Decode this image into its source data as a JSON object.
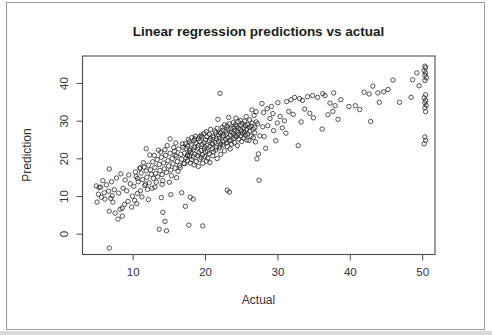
{
  "window": {
    "background": "#ffffff",
    "frame_border_color": "#9a9a9a"
  },
  "chart_data": {
    "type": "scatter",
    "title": "Linear regression predictions vs actual",
    "xlabel": "Actual",
    "ylabel": "Prediction",
    "xlim": [
      3.0,
      51.7
    ],
    "ylim": [
      -5.4,
      47.3
    ],
    "x_ticks": [
      10,
      20,
      30,
      40,
      50
    ],
    "y_ticks": [
      0,
      10,
      20,
      30,
      40
    ],
    "grid": false,
    "legend": "none",
    "marker": "open-circle",
    "marker_color": "#2a2a2a",
    "box_color": "#4d4d4d",
    "tick_label_color": "#333333",
    "points": [
      [
        4.9,
        12.8
      ],
      [
        5.3,
        12.4
      ],
      [
        5.5,
        12.5
      ],
      [
        5.2,
        10.6
      ],
      [
        5.0,
        8.5
      ],
      [
        6.1,
        9.3
      ],
      [
        6.9,
        9.5
      ],
      [
        6.6,
        11.4
      ],
      [
        7.2,
        8.5
      ],
      [
        6.7,
        6.1
      ],
      [
        7.5,
        5.6
      ],
      [
        8.2,
        6.6
      ],
      [
        8.5,
        4.8
      ],
      [
        7.9,
        4.0
      ],
      [
        8.8,
        7.9
      ],
      [
        9.3,
        8.7
      ],
      [
        9.9,
        10.1
      ],
      [
        7.0,
        13.9
      ],
      [
        7.7,
        14.9
      ],
      [
        8.3,
        16.0
      ],
      [
        6.7,
        17.3
      ],
      [
        5.8,
        14.2
      ],
      [
        6.3,
        13.1
      ],
      [
        7.4,
        11.8
      ],
      [
        8.0,
        10.9
      ],
      [
        8.6,
        12.2
      ],
      [
        9.1,
        11.5
      ],
      [
        9.6,
        13.4
      ],
      [
        10.1,
        12.7
      ],
      [
        8.5,
        6.9
      ],
      [
        7.1,
        10.2
      ],
      [
        6.0,
        11.0
      ],
      [
        5.6,
        9.8
      ],
      [
        10.2,
        9.0
      ],
      [
        9.8,
        7.2
      ],
      [
        10.5,
        8.1
      ],
      [
        11.2,
        9.9
      ],
      [
        10.3,
        16.5
      ],
      [
        11.0,
        17.6
      ],
      [
        10.6,
        14.8
      ],
      [
        9.4,
        15.7
      ],
      [
        8.9,
        14.4
      ],
      [
        6.7,
        -3.7
      ],
      [
        13.6,
        1.3
      ],
      [
        14.6,
        0.9
      ],
      [
        17.7,
        2.4
      ],
      [
        19.6,
        2.2
      ],
      [
        14.4,
        3.4
      ],
      [
        14.1,
        5.8
      ],
      [
        17.2,
        7.4
      ],
      [
        18.3,
        9.3
      ],
      [
        13.9,
        9.7
      ],
      [
        17.9,
        9.8
      ],
      [
        12.1,
        9.2
      ],
      [
        10.4,
        15.3
      ],
      [
        10.7,
        13.9
      ],
      [
        11.1,
        16.2
      ],
      [
        11.3,
        14.5
      ],
      [
        11.5,
        17.8
      ],
      [
        11.6,
        12.9
      ],
      [
        11.8,
        16.8
      ],
      [
        11.9,
        15.1
      ],
      [
        12.1,
        18.3
      ],
      [
        12.2,
        13.6
      ],
      [
        12.4,
        17.1
      ],
      [
        12.5,
        15.9
      ],
      [
        12.7,
        19.2
      ],
      [
        12.8,
        14.8
      ],
      [
        13.0,
        17.7
      ],
      [
        13.1,
        16.1
      ],
      [
        13.3,
        19.8
      ],
      [
        13.4,
        15.2
      ],
      [
        13.6,
        18.5
      ],
      [
        13.7,
        16.9
      ],
      [
        13.9,
        20.4
      ],
      [
        14.0,
        15.8
      ],
      [
        14.2,
        18.9
      ],
      [
        14.3,
        17.3
      ],
      [
        14.5,
        20.9
      ],
      [
        14.6,
        16.4
      ],
      [
        14.8,
        19.5
      ],
      [
        14.9,
        18.1
      ],
      [
        15.1,
        21.5
      ],
      [
        15.2,
        17.0
      ],
      [
        15.4,
        20.1
      ],
      [
        15.5,
        18.7
      ],
      [
        15.7,
        22.0
      ],
      [
        15.8,
        17.5
      ],
      [
        16.0,
        20.7
      ],
      [
        16.1,
        19.3
      ],
      [
        16.3,
        22.6
      ],
      [
        16.4,
        18.2
      ],
      [
        16.6,
        21.2
      ],
      [
        16.7,
        19.9
      ],
      [
        16.9,
        23.1
      ],
      [
        17.0,
        18.8
      ],
      [
        11.0,
        11.5
      ],
      [
        12.0,
        11.9
      ],
      [
        13.0,
        12.5
      ],
      [
        14.0,
        13.2
      ],
      [
        15.0,
        13.8
      ],
      [
        16.0,
        15.0
      ],
      [
        12.3,
        21.0
      ],
      [
        13.5,
        22.3
      ],
      [
        14.7,
        23.5
      ],
      [
        15.9,
        24.2
      ],
      [
        11.4,
        19.0
      ],
      [
        10.9,
        17.5
      ],
      [
        12.9,
        20.9
      ],
      [
        13.8,
        21.8
      ],
      [
        14.4,
        22.4
      ],
      [
        15.6,
        23.0
      ],
      [
        16.8,
        24.0
      ],
      [
        16.2,
        16.7
      ],
      [
        15.3,
        15.5
      ],
      [
        14.1,
        14.2
      ],
      [
        13.2,
        13.8
      ],
      [
        12.6,
        12.2
      ],
      [
        11.7,
        13.3
      ],
      [
        10.6,
        10.8
      ],
      [
        16.5,
        17.7
      ],
      [
        15.1,
        25.3
      ],
      [
        11.8,
        22.7
      ],
      [
        15.8,
        21.0
      ],
      [
        15.2,
        10.5
      ],
      [
        16.7,
        11.0
      ],
      [
        17.1,
        21.5
      ],
      [
        17.1,
        18.7
      ],
      [
        17.2,
        24.0
      ],
      [
        17.3,
        20.2
      ],
      [
        17.3,
        22.8
      ],
      [
        17.5,
        19.5
      ],
      [
        17.5,
        23.4
      ],
      [
        17.5,
        21.0
      ],
      [
        17.6,
        25.1
      ],
      [
        17.8,
        20.8
      ],
      [
        17.8,
        22.1
      ],
      [
        17.8,
        24.5
      ],
      [
        17.9,
        18.9
      ],
      [
        18.0,
        21.7
      ],
      [
        18.0,
        23.9
      ],
      [
        18.1,
        19.8
      ],
      [
        18.1,
        25.6
      ],
      [
        18.3,
        22.4
      ],
      [
        18.3,
        20.5
      ],
      [
        18.4,
        24.8
      ],
      [
        18.4,
        18.4
      ],
      [
        18.5,
        21.2
      ],
      [
        18.5,
        23.0
      ],
      [
        18.6,
        26.0
      ],
      [
        18.7,
        19.3
      ],
      [
        18.7,
        24.2
      ],
      [
        18.9,
        22.9
      ],
      [
        18.9,
        20.9
      ],
      [
        19.0,
        25.3
      ],
      [
        19.0,
        23.5
      ],
      [
        19.0,
        18.0
      ],
      [
        19.1,
        21.6
      ],
      [
        19.2,
        24.6
      ],
      [
        19.2,
        19.9
      ],
      [
        19.4,
        22.2
      ],
      [
        19.4,
        26.3
      ],
      [
        19.4,
        20.3
      ],
      [
        19.5,
        23.8
      ],
      [
        19.5,
        25.8
      ],
      [
        19.6,
        21.1
      ],
      [
        19.6,
        18.8
      ],
      [
        19.8,
        24.3
      ],
      [
        19.8,
        22.6
      ],
      [
        19.8,
        26.7
      ],
      [
        19.9,
        20.6
      ],
      [
        19.9,
        23.2
      ],
      [
        20.0,
        25.0
      ],
      [
        20.0,
        21.9
      ],
      [
        20.1,
        27.2
      ],
      [
        20.1,
        19.4
      ],
      [
        20.2,
        23.6
      ],
      [
        20.2,
        25.9
      ],
      [
        20.3,
        22.0
      ],
      [
        20.3,
        20.2
      ],
      [
        20.5,
        24.9
      ],
      [
        20.5,
        26.5
      ],
      [
        20.5,
        21.4
      ],
      [
        20.6,
        23.3
      ],
      [
        20.6,
        19.0
      ],
      [
        20.7,
        27.8
      ],
      [
        20.7,
        25.4
      ],
      [
        20.9,
        22.7
      ],
      [
        20.9,
        24.1
      ],
      [
        21.0,
        26.1
      ],
      [
        21.0,
        20.8
      ],
      [
        21.0,
        23.9
      ],
      [
        21.1,
        25.7
      ],
      [
        21.1,
        21.8
      ],
      [
        21.3,
        27.4
      ],
      [
        21.3,
        24.4
      ],
      [
        21.4,
        22.3
      ],
      [
        21.4,
        26.9
      ],
      [
        21.5,
        25.2
      ],
      [
        21.5,
        23.0
      ],
      [
        21.6,
        28.1
      ],
      [
        21.6,
        20.1
      ],
      [
        21.8,
        24.7
      ],
      [
        21.8,
        26.4
      ],
      [
        21.9,
        22.9
      ],
      [
        21.9,
        25.5
      ],
      [
        22.0,
        27.0
      ],
      [
        22.0,
        23.4
      ],
      [
        22.1,
        24.0
      ],
      [
        22.1,
        26.8
      ],
      [
        22.1,
        21.2
      ],
      [
        22.3,
        25.8
      ],
      [
        22.3,
        28.4
      ],
      [
        22.4,
        23.7
      ],
      [
        22.4,
        27.6
      ],
      [
        22.5,
        26.2
      ],
      [
        22.5,
        24.5
      ],
      [
        22.6,
        29.0
      ],
      [
        22.6,
        22.1
      ],
      [
        22.8,
        27.3
      ],
      [
        22.8,
        25.1
      ],
      [
        22.9,
        24.2
      ],
      [
        22.9,
        26.6
      ],
      [
        23.0,
        28.7
      ],
      [
        23.0,
        23.3
      ],
      [
        23.1,
        25.6
      ],
      [
        23.1,
        27.9
      ],
      [
        23.3,
        24.8
      ],
      [
        23.3,
        29.3
      ],
      [
        23.4,
        26.3
      ],
      [
        23.4,
        22.6
      ],
      [
        23.5,
        28.0
      ],
      [
        23.5,
        25.0
      ],
      [
        23.6,
        27.1
      ],
      [
        23.6,
        23.9
      ],
      [
        23.8,
        29.6
      ],
      [
        23.8,
        26.7
      ],
      [
        23.9,
        25.4
      ],
      [
        23.9,
        28.3
      ],
      [
        24.0,
        27.5
      ],
      [
        24.0,
        24.3
      ],
      [
        24.1,
        26.0
      ],
      [
        24.1,
        29.0
      ],
      [
        24.3,
        28.6
      ],
      [
        24.3,
        25.9
      ],
      [
        24.4,
        27.2
      ],
      [
        24.4,
        23.5
      ],
      [
        24.5,
        29.9
      ],
      [
        24.5,
        26.5
      ],
      [
        24.6,
        28.1
      ],
      [
        24.6,
        25.2
      ],
      [
        24.8,
        27.7
      ],
      [
        24.8,
        30.2
      ],
      [
        24.9,
        26.1
      ],
      [
        24.9,
        28.9
      ],
      [
        25.0,
        24.6
      ],
      [
        25.0,
        27.4
      ],
      [
        25.1,
        29.4
      ],
      [
        25.1,
        26.8
      ],
      [
        25.3,
        28.2
      ],
      [
        25.3,
        25.5
      ],
      [
        25.4,
        30.0
      ],
      [
        25.4,
        27.0
      ],
      [
        25.5,
        26.3
      ],
      [
        25.5,
        28.8
      ],
      [
        25.7,
        25.0
      ],
      [
        25.7,
        27.8
      ],
      [
        25.8,
        29.1
      ],
      [
        25.8,
        26.6
      ],
      [
        26.0,
        28.4
      ],
      [
        26.0,
        24.9
      ],
      [
        26.1,
        27.3
      ],
      [
        26.1,
        30.3
      ],
      [
        26.3,
        26.0
      ],
      [
        26.3,
        28.7
      ],
      [
        26.4,
        29.5
      ],
      [
        26.6,
        27.9
      ],
      [
        26.6,
        25.6
      ],
      [
        26.8,
        28.3
      ],
      [
        26.8,
        26.9
      ],
      [
        27.0,
        29.8
      ],
      [
        21.7,
        30.5
      ],
      [
        23.2,
        31.0
      ],
      [
        25.6,
        31.2
      ],
      [
        24.2,
        30.8
      ],
      [
        18.5,
        25.3
      ],
      [
        19.2,
        25.9
      ],
      [
        17.5,
        20.8
      ],
      [
        17.9,
        22.4
      ],
      [
        27.8,
        34.7
      ],
      [
        28.5,
        33.3
      ],
      [
        29.1,
        33.9
      ],
      [
        28.0,
        32.3
      ],
      [
        29.3,
        32.0
      ],
      [
        30.0,
        34.9
      ],
      [
        31.2,
        35.2
      ],
      [
        31.8,
        35.7
      ],
      [
        32.3,
        36.3
      ],
      [
        33.0,
        36.0
      ],
      [
        33.4,
        35.5
      ],
      [
        34.1,
        36.5
      ],
      [
        34.8,
        36.8
      ],
      [
        35.5,
        36.3
      ],
      [
        36.2,
        37.3
      ],
      [
        27.2,
        29.3
      ],
      [
        27.9,
        28.5
      ],
      [
        28.6,
        28.8
      ],
      [
        27.5,
        26.1
      ],
      [
        28.1,
        25.9
      ],
      [
        29.4,
        27.5
      ],
      [
        29.7,
        24.8
      ],
      [
        32.8,
        23.5
      ],
      [
        27.3,
        21.3
      ],
      [
        27.1,
        20.0
      ],
      [
        30.3,
        31.2
      ],
      [
        30.9,
        30.1
      ],
      [
        31.5,
        32.6
      ],
      [
        32.1,
        31.8
      ],
      [
        33.7,
        33.2
      ],
      [
        34.4,
        32.1
      ],
      [
        30.6,
        28.2
      ],
      [
        31.1,
        26.8
      ],
      [
        33.2,
        29.8
      ],
      [
        34.9,
        30.9
      ],
      [
        28.9,
        30.7
      ],
      [
        29.9,
        29.5
      ],
      [
        26.7,
        31.5
      ],
      [
        26.4,
        33.0
      ],
      [
        27.0,
        32.5
      ],
      [
        26.9,
        24.5
      ],
      [
        28.3,
        22.8
      ],
      [
        36.5,
        36.8
      ],
      [
        37.7,
        37.5
      ],
      [
        37.2,
        34.8
      ],
      [
        37.9,
        34.1
      ],
      [
        37.6,
        32.6
      ],
      [
        36.9,
        31.7
      ],
      [
        38.7,
        35.7
      ],
      [
        39.8,
        33.9
      ],
      [
        41.3,
        33.1
      ],
      [
        41.9,
        37.7
      ],
      [
        42.6,
        37.2
      ],
      [
        43.1,
        39.3
      ],
      [
        43.8,
        37.5
      ],
      [
        44.0,
        35.0
      ],
      [
        44.6,
        37.8
      ],
      [
        45.2,
        38.4
      ],
      [
        45.9,
        40.9
      ],
      [
        42.8,
        29.9
      ],
      [
        46.8,
        35.0
      ],
      [
        48.4,
        36.3
      ],
      [
        48.6,
        41.0
      ],
      [
        49.2,
        42.8
      ],
      [
        49.5,
        39.4
      ],
      [
        36.1,
        27.9
      ],
      [
        40.7,
        34.1
      ],
      [
        38.3,
        30.5
      ],
      [
        50.3,
        44.6
      ],
      [
        50.4,
        44.2
      ],
      [
        50.2,
        43.4
      ],
      [
        50.4,
        42.8
      ],
      [
        50.3,
        42.2
      ],
      [
        50.5,
        41.5
      ],
      [
        50.3,
        40.8
      ],
      [
        50.4,
        37.0
      ],
      [
        50.2,
        36.2
      ],
      [
        50.4,
        35.5
      ],
      [
        50.3,
        34.9
      ],
      [
        50.5,
        34.2
      ],
      [
        50.3,
        33.6
      ],
      [
        50.4,
        32.5
      ],
      [
        50.3,
        25.8
      ],
      [
        50.4,
        24.9
      ],
      [
        50.2,
        24.0
      ],
      [
        22.0,
        37.4
      ],
      [
        27.4,
        14.3
      ],
      [
        23.0,
        11.7
      ],
      [
        23.3,
        11.2
      ]
    ]
  }
}
